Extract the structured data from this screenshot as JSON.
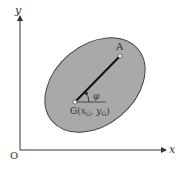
{
  "diagram": {
    "axes": {
      "x_label": "x",
      "y_label": "y",
      "origin_label": "O"
    },
    "points": {
      "A": {
        "label": "A"
      },
      "G": {
        "label_prefix": "G(",
        "x_sub": "x",
        "sub_x": "G",
        "comma": ", ",
        "y_sub": "y",
        "sub_y": "G",
        "label_suffix": ")"
      }
    },
    "angle_label": "φ",
    "colors": {
      "ellipse_fill": "#a9a9a9",
      "ellipse_stroke": "#444444",
      "axis": "#333333",
      "segment": "#111111",
      "point_fill": "#ffffff",
      "background": "#ffffff"
    }
  }
}
